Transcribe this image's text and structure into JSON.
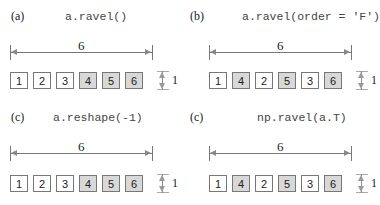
{
  "panels": [
    {
      "label": "(a)",
      "code": "a.ravel()",
      "length": "6",
      "height": "1",
      "cells": [
        {
          "v": "1",
          "shaded": false
        },
        {
          "v": "2",
          "shaded": false
        },
        {
          "v": "3",
          "shaded": false
        },
        {
          "v": "4",
          "shaded": true
        },
        {
          "v": "5",
          "shaded": true
        },
        {
          "v": "6",
          "shaded": true
        }
      ]
    },
    {
      "label": "(b)",
      "code": "a.ravel(order = 'F')",
      "length": "6",
      "height": "1",
      "cells": [
        {
          "v": "1",
          "shaded": false
        },
        {
          "v": "4",
          "shaded": true
        },
        {
          "v": "2",
          "shaded": false
        },
        {
          "v": "5",
          "shaded": true
        },
        {
          "v": "3",
          "shaded": false
        },
        {
          "v": "6",
          "shaded": true
        }
      ]
    },
    {
      "label": "(c)",
      "code": "a.reshape(-1)",
      "length": "6",
      "height": "1",
      "cells": [
        {
          "v": "1",
          "shaded": false
        },
        {
          "v": "2",
          "shaded": false
        },
        {
          "v": "3",
          "shaded": false
        },
        {
          "v": "4",
          "shaded": true
        },
        {
          "v": "5",
          "shaded": true
        },
        {
          "v": "6",
          "shaded": true
        }
      ]
    },
    {
      "label": "(c)",
      "code": "np.ravel(a.T)",
      "length": "6",
      "height": "1",
      "cells": [
        {
          "v": "1",
          "shaded": false
        },
        {
          "v": "4",
          "shaded": true
        },
        {
          "v": "2",
          "shaded": false
        },
        {
          "v": "5",
          "shaded": true
        },
        {
          "v": "3",
          "shaded": false
        },
        {
          "v": "6",
          "shaded": true
        }
      ]
    }
  ]
}
